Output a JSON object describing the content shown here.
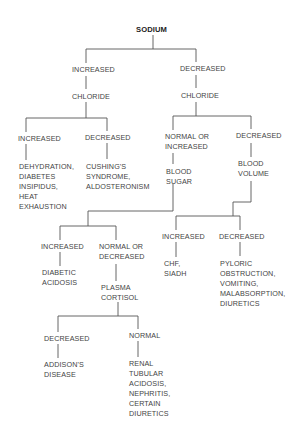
{
  "diagram": {
    "title": "SODIUM",
    "nodes": {
      "root": "SODIUM",
      "na_increased": "INCREASED",
      "na_increased_test": "CHLORIDE",
      "na_decreased": "DECREASED",
      "na_decreased_test": "CHLORIDE",
      "cl1_increased": "INCREASED",
      "cl1_increased_dx": "DEHYDRATION,\nDIABETES\nINSIPIDUS,\nHEAT\nEXHAUSTION",
      "cl1_decreased": "DECREASED",
      "cl1_decreased_dx": "CUSHING'S\nSYNDROME,\nALDOSTERONISM",
      "cl2_normal_increased": "NORMAL OR\nINCREASED",
      "cl2_normal_increased_test": "BLOOD\nSUGAR",
      "cl2_decreased": "DECREASED",
      "cl2_decreased_test": "BLOOD\nVOLUME",
      "bs_increased": "INCREASED",
      "bs_increased_dx": "DIABETIC\nACIDOSIS",
      "bs_normal_decreased": "NORMAL OR\nDECREASED",
      "bs_normal_decreased_test": "PLASMA\nCORTISOL",
      "bv_increased": "INCREASED",
      "bv_increased_dx": "CHF,\nSIADH",
      "bv_decreased": "DECREASED",
      "bv_decreased_dx": "PYLORIC\nOBSTRUCTION,\nVOMITING,\nMALABSORPTION,\nDIURETICS",
      "pc_decreased": "DECREASED",
      "pc_decreased_dx": "ADDISON'S\nDISEASE",
      "pc_normal": "NORMAL",
      "pc_normal_dx": "RENAL\nTUBULAR\nACIDOSIS,\nNEPHRITIS,\nCERTAIN\nDIURETICS"
    }
  }
}
